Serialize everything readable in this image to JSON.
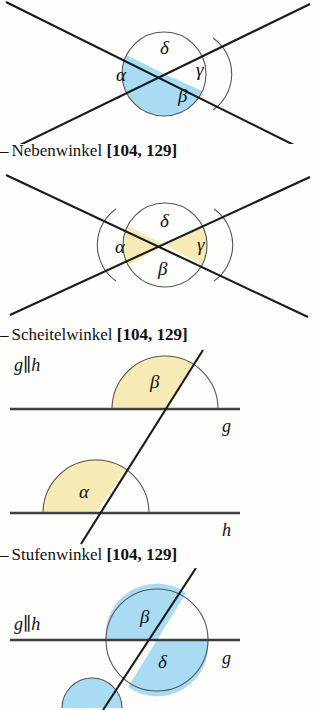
{
  "document": {
    "language": "de",
    "kind": "textbook-geometry-figure-list",
    "colors": {
      "highlight_blue": "#a9dcf2",
      "highlight_yellow": "#f6ebb4",
      "line": "#1a1a1a",
      "arc": "#3a3a3a",
      "page_background": "#fdfdfc"
    }
  },
  "entries": [
    {
      "id": "entry-nebenwinkel",
      "caption": {
        "dash": "–",
        "name": "Nebenwinkel",
        "pages": "[104, 129]"
      },
      "figure": {
        "id": "figure-nebenwinkel",
        "type": "two-crossing-lines",
        "description": "Zwei sich schneidende Geraden mit vier Winkeln",
        "angles": [
          {
            "label": "α",
            "position": "left",
            "highlight": "blue"
          },
          {
            "label": "β",
            "position": "bottom",
            "highlight": "blue"
          },
          {
            "label": "γ",
            "position": "right",
            "highlight": "none"
          },
          {
            "label": "δ",
            "position": "top",
            "highlight": "none"
          }
        ]
      }
    },
    {
      "id": "entry-scheitelwinkel",
      "caption": {
        "dash": "–",
        "name": "Scheitelwinkel",
        "pages": "[104, 129]"
      },
      "figure": {
        "id": "figure-scheitelwinkel",
        "type": "two-crossing-lines",
        "description": "Zwei sich schneidende Geraden, Scheitelwinkel hervorgehoben",
        "angles": [
          {
            "label": "α",
            "position": "left",
            "highlight": "yellow"
          },
          {
            "label": "β",
            "position": "bottom",
            "highlight": "none"
          },
          {
            "label": "γ",
            "position": "right",
            "highlight": "yellow"
          },
          {
            "label": "δ",
            "position": "top",
            "highlight": "none"
          }
        ]
      }
    },
    {
      "id": "entry-stufenwinkel",
      "caption": {
        "dash": "–",
        "name": "Stufenwinkel",
        "pages": "[104, 129]"
      },
      "figure": {
        "id": "figure-stufenwinkel",
        "type": "parallel-lines-with-transversal",
        "description": "Zwei parallele Geraden g und h mit Schnittgerade",
        "parallel_note": "g‖h",
        "line_labels": {
          "upper": "g",
          "lower": "h"
        },
        "angles": [
          {
            "label": "β",
            "on_line": "g",
            "position": "upper-left",
            "highlight": "yellow"
          },
          {
            "label": "α",
            "on_line": "h",
            "position": "upper-left",
            "highlight": "yellow"
          }
        ]
      }
    },
    {
      "id": "entry-wechselwinkel-partial",
      "caption": null,
      "figure": {
        "id": "figure-wechselwinkel-partial",
        "type": "parallel-lines-with-transversal",
        "description": "Zwei parallele Geraden mit Schnittgerade, unten abgeschnitten",
        "parallel_note": "g‖h",
        "line_labels": {
          "upper": "g"
        },
        "angles": [
          {
            "label": "β",
            "on_line": "g",
            "position": "upper-left",
            "highlight": "blue"
          },
          {
            "label": "δ",
            "on_line": "g",
            "position": "lower-right",
            "highlight": "blue"
          }
        ]
      }
    }
  ]
}
